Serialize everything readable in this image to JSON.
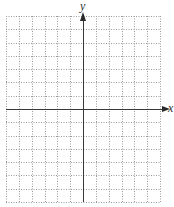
{
  "diagram": {
    "type": "coordinate-plane",
    "grid": {
      "columns": 12,
      "rows": 14,
      "line_style": "dotted",
      "line_color": "#9a9a9a"
    },
    "x_axis": {
      "label": "x",
      "position_row": 7,
      "arrow": "right"
    },
    "y_axis": {
      "label": "y",
      "position_col": 6,
      "arrow": "up"
    },
    "axis_color": "#3a3a3a"
  }
}
